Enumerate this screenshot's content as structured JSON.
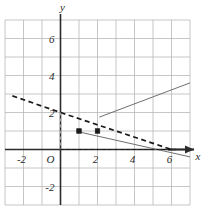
{
  "figure": {
    "kind": "cartesian-coordinate-plane-graph",
    "background_color": "#ffffff"
  },
  "axes": {
    "x_axis_label": "x",
    "y_axis_label": "y",
    "origin_label": "O",
    "axis_color": "#2b2b2b",
    "grid_color": "#b8b8b8",
    "x_ticks": [
      {
        "value": -2,
        "label": "-2"
      },
      {
        "value": 2,
        "label": "2"
      },
      {
        "value": 4,
        "label": "4"
      },
      {
        "value": 6,
        "label": "6"
      }
    ],
    "y_ticks": [
      {
        "value": -2,
        "label": "-2"
      },
      {
        "value": 2,
        "label": "2"
      },
      {
        "value": 4,
        "label": "4"
      },
      {
        "value": 6,
        "label": "6"
      }
    ],
    "x_range": [
      -3,
      7
    ],
    "y_range": [
      -3,
      7
    ],
    "grid_visible": true,
    "x_arrow": true,
    "y_arrow": false
  },
  "chart_data": {
    "type": "line",
    "title": "",
    "xlabel": "x",
    "ylabel": "y",
    "xlim": [
      -3,
      7
    ],
    "ylim": [
      -3,
      7
    ],
    "grid": true,
    "legend": "none",
    "series": [
      {
        "name": "dashed-line",
        "style": "dashed",
        "color": "#1a1a1a",
        "points": [
          [
            -2.6,
            2.9
          ],
          [
            0,
            2
          ],
          [
            6,
            0
          ]
        ]
      },
      {
        "name": "solid-ray-up-right",
        "style": "solid",
        "color": "#6f6f6f",
        "points": [
          [
            2.1,
            1.75
          ],
          [
            7.0,
            3.6
          ]
        ]
      },
      {
        "name": "solid-ray-down-right",
        "style": "solid",
        "color": "#6f6f6f",
        "points": [
          [
            1.0,
            0.95
          ],
          [
            7.0,
            -0.4
          ]
        ]
      },
      {
        "name": "guide-vertical-dashed",
        "style": "dashed",
        "color": "#9a9a9a",
        "points": [
          [
            0,
            2
          ],
          [
            0,
            0
          ]
        ]
      },
      {
        "name": "guide-horizontal-dashed",
        "style": "dashed",
        "color": "#1a1a1a",
        "points": [
          [
            0,
            0
          ],
          [
            6,
            0
          ]
        ]
      }
    ],
    "markers": [
      {
        "name": "point-marker-a",
        "x": 1,
        "y": 1,
        "shape": "square",
        "color": "#1a1a1a"
      },
      {
        "name": "point-marker-b",
        "x": 2,
        "y": 1,
        "shape": "square",
        "color": "#1a1a1a"
      }
    ]
  }
}
